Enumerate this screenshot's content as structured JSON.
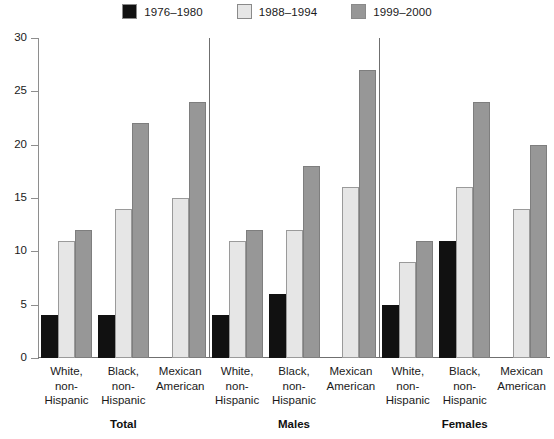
{
  "chart_data": {
    "type": "bar",
    "title": "",
    "subtitle": "",
    "xlabel": "",
    "ylabel": "",
    "ylim": [
      0,
      30
    ],
    "ytick_step": 5,
    "yticks": [
      30,
      25,
      20,
      15,
      10,
      5,
      0
    ],
    "grid": false,
    "legend_position": "top-center",
    "series": [
      {
        "name": "1976–1980",
        "color": "#111111",
        "values": [
          4,
          4,
          null,
          4,
          6,
          null,
          5,
          11,
          null
        ]
      },
      {
        "name": "1988–1994",
        "color": "#e6e6e6",
        "values": [
          11,
          14,
          15,
          11,
          12,
          16,
          9,
          16,
          14
        ]
      },
      {
        "name": "1999–2000",
        "color": "#979797",
        "values": [
          12,
          22,
          24,
          12,
          18,
          27,
          11,
          24,
          20
        ]
      }
    ],
    "categories": [
      "White, non-Hispanic",
      "Black, non-Hispanic",
      "Mexican American",
      "White, non-Hispanic",
      "Black, non-Hispanic",
      "Mexican American",
      "White, non-Hispanic",
      "Black, non-Hispanic",
      "Mexican American"
    ],
    "panels": [
      "Total",
      "Males",
      "Females"
    ]
  },
  "legend": {
    "items": [
      {
        "label": "1976–1980",
        "color": "#111111",
        "swatch": "legend-swatch-1976-1980"
      },
      {
        "label": "1988–1994",
        "color": "#e6e6e6",
        "swatch": "legend-swatch-1988-1994"
      },
      {
        "label": "1999–2000",
        "color": "#979797",
        "swatch": "legend-swatch-1999-2000"
      }
    ]
  },
  "axis": {
    "y_ticks": [
      "30",
      "25",
      "20",
      "15",
      "10",
      "5",
      "0"
    ]
  },
  "categories": {
    "lines": [
      [
        "White,",
        "non-",
        "Hispanic"
      ],
      [
        "Black,",
        "non-",
        "Hispanic"
      ],
      [
        "Mexican",
        "American",
        ""
      ],
      [
        "White,",
        "non-",
        "Hispanic"
      ],
      [
        "Black,",
        "non-",
        "Hispanic"
      ],
      [
        "Mexican",
        "American",
        ""
      ],
      [
        "White,",
        "non-",
        "Hispanic"
      ],
      [
        "Black,",
        "non-",
        "Hispanic"
      ],
      [
        "Mexican",
        "American",
        ""
      ]
    ]
  },
  "panels": [
    {
      "label": "Total"
    },
    {
      "label": "Males"
    },
    {
      "label": "Females"
    }
  ]
}
